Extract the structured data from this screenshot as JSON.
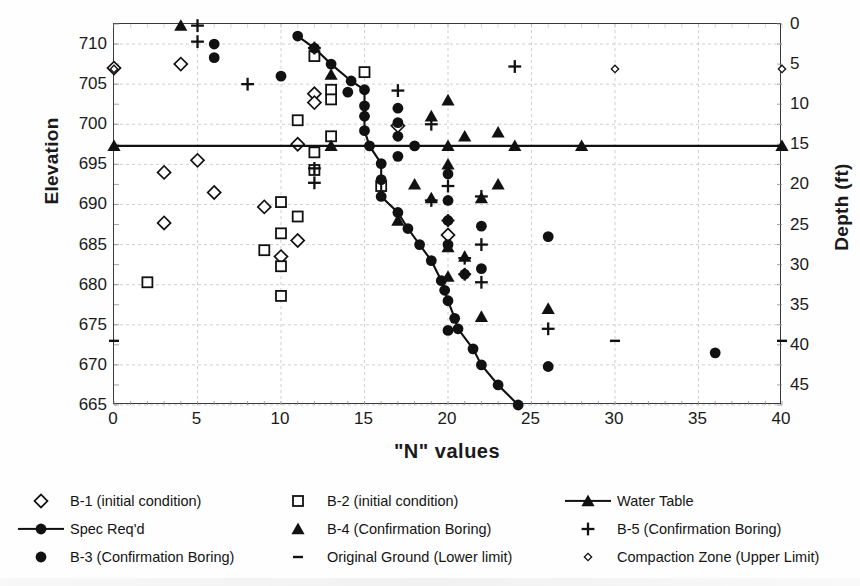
{
  "chart_data": {
    "type": "scatter",
    "title": "",
    "xlabel": "\"N\" values",
    "ylabel": "Elevation",
    "y2label": "Depth (ft)",
    "xlim": [
      0,
      40
    ],
    "ylim": [
      665,
      712.5
    ],
    "y2lim": [
      0,
      47.5
    ],
    "grid": true,
    "legend_position": "bottom",
    "xticks": [
      "0",
      "5",
      "10",
      "15",
      "20",
      "25",
      "30",
      "35",
      "40"
    ],
    "xtick_values": [
      0,
      5,
      10,
      15,
      20,
      25,
      30,
      35,
      40
    ],
    "yticks": [
      "710",
      "705",
      "700",
      "695",
      "690",
      "685",
      "680",
      "675",
      "670",
      "665"
    ],
    "ytick_values": [
      710,
      705,
      700,
      695,
      690,
      685,
      680,
      675,
      670,
      665
    ],
    "y2ticks": [
      "0",
      "5",
      "10",
      "15",
      "20",
      "25",
      "30",
      "35",
      "40",
      "45"
    ],
    "y2tick_values": [
      0,
      5,
      10,
      15,
      20,
      25,
      30,
      35,
      40,
      45
    ],
    "series": [
      {
        "name": "B-1 (initial condition)",
        "marker": "open-diamond",
        "line": false,
        "points": [
          [
            0,
            707.0
          ],
          [
            4,
            707.5
          ],
          [
            12,
            703.8
          ],
          [
            12,
            702.7
          ],
          [
            11,
            697.5
          ],
          [
            5,
            695.5
          ],
          [
            3,
            694.0
          ],
          [
            6,
            691.5
          ],
          [
            3,
            687.7
          ],
          [
            9,
            689.7
          ],
          [
            11,
            685.5
          ],
          [
            10,
            683.5
          ],
          [
            17,
            699.8
          ],
          [
            20,
            686.2
          ]
        ]
      },
      {
        "name": "B-2 (initial condition)",
        "marker": "open-square",
        "line": false,
        "points": [
          [
            12,
            708.5
          ],
          [
            15,
            706.5
          ],
          [
            13,
            704.3
          ],
          [
            13,
            703.1
          ],
          [
            11,
            700.5
          ],
          [
            13,
            698.5
          ],
          [
            12,
            696.5
          ],
          [
            12,
            694.3
          ],
          [
            10,
            690.3
          ],
          [
            11,
            688.5
          ],
          [
            10,
            686.4
          ],
          [
            9,
            684.3
          ],
          [
            10,
            682.3
          ],
          [
            2,
            680.3
          ],
          [
            10,
            678.6
          ],
          [
            16,
            692.3
          ]
        ]
      },
      {
        "name": "Spec Req'd",
        "marker": "filled-circle",
        "line": true,
        "points": [
          [
            11,
            711.0
          ],
          [
            12,
            709.5
          ],
          [
            13,
            707.5
          ],
          [
            14.2,
            705.4
          ],
          [
            15,
            704.3
          ],
          [
            15,
            702.3
          ],
          [
            15,
            701.0
          ],
          [
            15,
            699.2
          ],
          [
            15.3,
            697.3
          ],
          [
            16,
            695.1
          ],
          [
            16,
            693.1
          ],
          [
            16,
            691.0
          ],
          [
            17,
            689.0
          ],
          [
            17.6,
            687.0
          ],
          [
            18.3,
            685.0
          ],
          [
            19,
            683.0
          ],
          [
            19.6,
            680.5
          ],
          [
            19.8,
            679.3
          ],
          [
            20,
            678.0
          ],
          [
            20.4,
            675.8
          ],
          [
            20.6,
            674.5
          ],
          [
            21.5,
            672.0
          ],
          [
            22,
            670.0
          ],
          [
            23,
            667.5
          ],
          [
            24.2,
            665.0
          ]
        ]
      },
      {
        "name": "B-3 (Confirmation Boring)",
        "marker": "filled-circle",
        "line": false,
        "points": [
          [
            6,
            710.0
          ],
          [
            6,
            708.3
          ],
          [
            10,
            706.0
          ],
          [
            14,
            704.0
          ],
          [
            17,
            702.0
          ],
          [
            17,
            700.2
          ],
          [
            17,
            698.5
          ],
          [
            17,
            696.0
          ],
          [
            18,
            697.3
          ],
          [
            20,
            693.8
          ],
          [
            20,
            690.5
          ],
          [
            20,
            688.0
          ],
          [
            22,
            687.3
          ],
          [
            20,
            685.0
          ],
          [
            22,
            682.0
          ],
          [
            21,
            681.3
          ],
          [
            20,
            674.3
          ],
          [
            26,
            686.0
          ],
          [
            26,
            669.8
          ],
          [
            36,
            671.5
          ]
        ]
      },
      {
        "name": "B-4 (Confirmation Boring)",
        "marker": "filled-triangle",
        "line": false,
        "points": [
          [
            4,
            712.3
          ],
          [
            13,
            706.2
          ],
          [
            20,
            703.0
          ],
          [
            19,
            701.0
          ],
          [
            23,
            699.0
          ],
          [
            21,
            698.5
          ],
          [
            20,
            695.0
          ],
          [
            18,
            692.5
          ],
          [
            23,
            692.5
          ],
          [
            19,
            690.8
          ],
          [
            22,
            690.8
          ],
          [
            17,
            688.0
          ],
          [
            20,
            684.7
          ],
          [
            21,
            683.5
          ],
          [
            20,
            681.0
          ],
          [
            22,
            676.0
          ],
          [
            26,
            677.0
          ]
        ]
      },
      {
        "name": "B-5 (Confirmation Boring)",
        "marker": "plus",
        "line": false,
        "points": [
          [
            5,
            712.3
          ],
          [
            5,
            710.3
          ],
          [
            12,
            709.5
          ],
          [
            8,
            705.0
          ],
          [
            17,
            704.2
          ],
          [
            19,
            700.0
          ],
          [
            12,
            694.5
          ],
          [
            12,
            692.7
          ],
          [
            20,
            692.3
          ],
          [
            22,
            691.0
          ],
          [
            19,
            690.5
          ],
          [
            20,
            688.0
          ],
          [
            22,
            685.0
          ],
          [
            21,
            683.3
          ],
          [
            21,
            681.3
          ],
          [
            22,
            680.3
          ],
          [
            26,
            674.5
          ],
          [
            24,
            707.2
          ]
        ]
      },
      {
        "name": "Water Table",
        "marker": "filled-triangle",
        "line": true,
        "points": [
          [
            0,
            697.3
          ],
          [
            13,
            697.3
          ],
          [
            20,
            697.3
          ],
          [
            24,
            697.3
          ],
          [
            28,
            697.3
          ],
          [
            40,
            697.3
          ]
        ]
      },
      {
        "name": "Original Ground (Lower limit)",
        "marker": "dash",
        "line": false,
        "points": [
          [
            0,
            673.0
          ],
          [
            30,
            673.0
          ],
          [
            40,
            673.0
          ]
        ]
      },
      {
        "name": "Compaction Zone (Upper Limit)",
        "marker": "tiny-diamond",
        "line": false,
        "points": [
          [
            0,
            706.9
          ],
          [
            30,
            706.9
          ],
          [
            40,
            706.9
          ]
        ]
      }
    ]
  },
  "legend": {
    "items": [
      {
        "label": "B-1 (initial condition)",
        "marker": "open-diamond",
        "line": false
      },
      {
        "label": "B-2 (initial condition)",
        "marker": "open-square",
        "line": false
      },
      {
        "label": "Water Table",
        "marker": "filled-triangle",
        "line": true
      },
      {
        "label": "Spec Req'd",
        "marker": "filled-circle",
        "line": true
      },
      {
        "label": "B-4 (Confirmation Boring)",
        "marker": "filled-triangle",
        "line": false
      },
      {
        "label": "B-5 (Confirmation Boring)",
        "marker": "plus",
        "line": false
      },
      {
        "label": "B-3 (Confirmation Boring)",
        "marker": "filled-circle",
        "line": false
      },
      {
        "label": "Original Ground (Lower limit)",
        "marker": "dash",
        "line": false
      },
      {
        "label": "Compaction Zone (Upper Limit)",
        "marker": "tiny-diamond",
        "line": false
      }
    ]
  },
  "colors": {
    "ink": "#111111",
    "axis": "#3a3a3a",
    "grid": "#c9c9c9",
    "background": "#ffffff"
  }
}
